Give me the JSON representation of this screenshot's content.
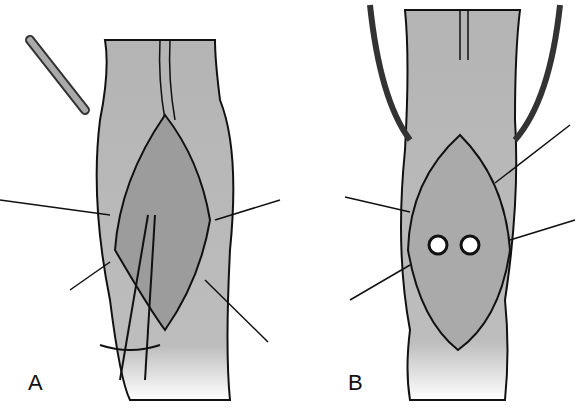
{
  "figure": {
    "panels": [
      {
        "label": "A",
        "description": "Bowel segment with opened incision, retractor, suture lines and forceps"
      },
      {
        "label": "B",
        "description": "Bowel segment with opened incision showing two ostia and tube catheters"
      }
    ],
    "colors": {
      "tissue": "#b8b8b8",
      "outline": "#111111",
      "background": "#ffffff"
    }
  }
}
